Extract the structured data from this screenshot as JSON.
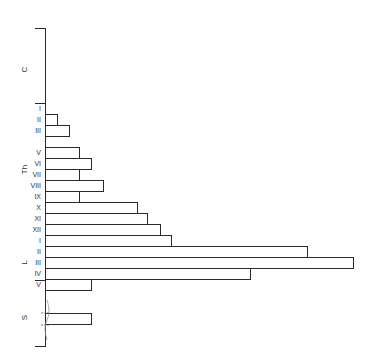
{
  "chart_data": {
    "type": "bar",
    "orientation": "horizontal",
    "title": "",
    "xlabel": "",
    "ylabel": "",
    "axis": {
      "x": 45,
      "top": 28,
      "bottom": 346,
      "scale_px_per_unit": 1
    },
    "groups": [
      {
        "name": "C",
        "label_y": 70,
        "top": 28,
        "bottom": 103
      },
      {
        "name": "Th",
        "label_y": 170,
        "top": 103,
        "bottom": 235
      },
      {
        "name": "L",
        "label_y": 263,
        "top": 235,
        "bottom": 291
      },
      {
        "name": "S",
        "label_y": 318,
        "top": 291,
        "bottom": 346
      }
    ],
    "separators": [
      28,
      103,
      280,
      346
    ],
    "categories": [
      "Th-I",
      "Th-II",
      "Th-III",
      "Th-IV",
      "Th-V",
      "Th-VI",
      "Th-VII",
      "Th-VIII",
      "Th-IX",
      "Th-X",
      "Th-XI",
      "Th-XII",
      "L-I",
      "L-II",
      "L-III",
      "L-IV",
      "L-V",
      "S"
    ],
    "rows": [
      {
        "group": "Th",
        "label": "I",
        "top": 103,
        "value": 0
      },
      {
        "group": "Th",
        "label": "II",
        "top": 114,
        "value": 12
      },
      {
        "group": "Th",
        "label": "III",
        "top": 125,
        "value": 24
      },
      {
        "group": "Th",
        "label": "",
        "top": 136,
        "value": 0
      },
      {
        "group": "Th",
        "label": "V",
        "top": 147,
        "value": 34
      },
      {
        "group": "Th",
        "label": "VI",
        "top": 158,
        "value": 46
      },
      {
        "group": "Th",
        "label": "VII",
        "top": 169,
        "value": 34
      },
      {
        "group": "Th",
        "label": "VIII",
        "top": 180,
        "value": 58
      },
      {
        "group": "Th",
        "label": "IX",
        "top": 191,
        "value": 34
      },
      {
        "group": "Th",
        "label": "X",
        "top": 202,
        "value": 92
      },
      {
        "group": "Th",
        "label": "XI",
        "top": 213,
        "value": 102
      },
      {
        "group": "Th",
        "label": "XII",
        "top": 224,
        "value": 115
      },
      {
        "group": "L",
        "label": "I",
        "top": 235,
        "value": 126
      },
      {
        "group": "L",
        "label": "II",
        "top": 246,
        "value": 262
      },
      {
        "group": "L",
        "label": "III",
        "top": 257,
        "value": 308
      },
      {
        "group": "L",
        "label": "IV",
        "top": 268,
        "value": 205
      },
      {
        "group": "L",
        "label": "V",
        "top": 279,
        "value": 46
      },
      {
        "group": "S",
        "label": "",
        "top": 313,
        "value": 46
      }
    ],
    "values": [
      0,
      12,
      24,
      0,
      34,
      46,
      34,
      58,
      34,
      92,
      102,
      115,
      126,
      262,
      308,
      205,
      46,
      46
    ],
    "row_height": 11.3,
    "grid": false,
    "legend": null,
    "annotations": [
      "axis-break marks in S region"
    ]
  }
}
